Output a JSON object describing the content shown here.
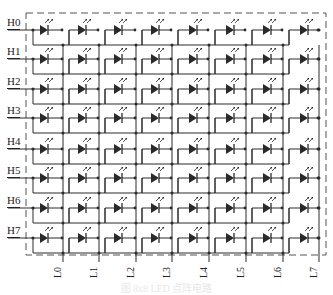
{
  "diagram": {
    "row_labels": [
      "H0",
      "H1",
      "H2",
      "H3",
      "H4",
      "H5",
      "H6",
      "H7"
    ],
    "column_labels": [
      "L0",
      "L1",
      "L2",
      "L3",
      "L4",
      "L5",
      "L6",
      "L7"
    ],
    "rows": 8,
    "columns": 8,
    "component": "LED",
    "colors": {
      "line": "#2a2a2a",
      "border": "#555555",
      "background": "#ffffff"
    }
  },
  "caption": "图 8x8 LED 点阵电路"
}
